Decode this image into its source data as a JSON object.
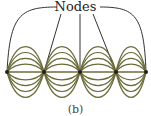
{
  "diagram": {
    "label": "Nodes",
    "caption": "(b)",
    "colors": {
      "wave": "#6b6b3a",
      "pointer": "#333333",
      "node": "#222222"
    },
    "nodes_x": [
      7,
      44,
      80,
      116,
      146
    ],
    "axis_y": 72,
    "amplitudes": [
      8,
      14,
      20,
      26
    ]
  }
}
